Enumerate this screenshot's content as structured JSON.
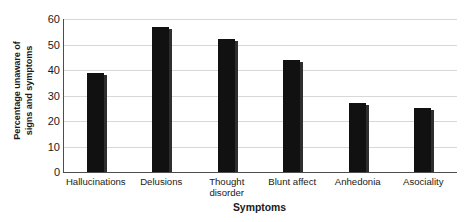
{
  "chart_data": {
    "type": "bar",
    "title": "",
    "xlabel": "Symptoms",
    "ylabel": "Percentage unaware of signs and symptoms",
    "ylabel_line1": "Percentage unaware of",
    "ylabel_line2": "signs and symptoms",
    "categories": [
      "Hallucinations",
      "Delusions",
      "Thought\ndisorder",
      "Blunt affect",
      "Anhedonia",
      "Asociality"
    ],
    "values": [
      39,
      57,
      52,
      44,
      27,
      25
    ],
    "ylim": [
      0,
      60
    ],
    "yticks": [
      0,
      10,
      20,
      30,
      40,
      50,
      60
    ],
    "ytick_labels": [
      "0",
      "10",
      "20",
      "30",
      "40",
      "50",
      "60"
    ],
    "grid": true,
    "grid_axis": "y",
    "legend": false,
    "bar_color": "#111111",
    "grid_color": "#d8d8d8",
    "axis_color": "#4d4d4d",
    "background": "#ffffff"
  }
}
